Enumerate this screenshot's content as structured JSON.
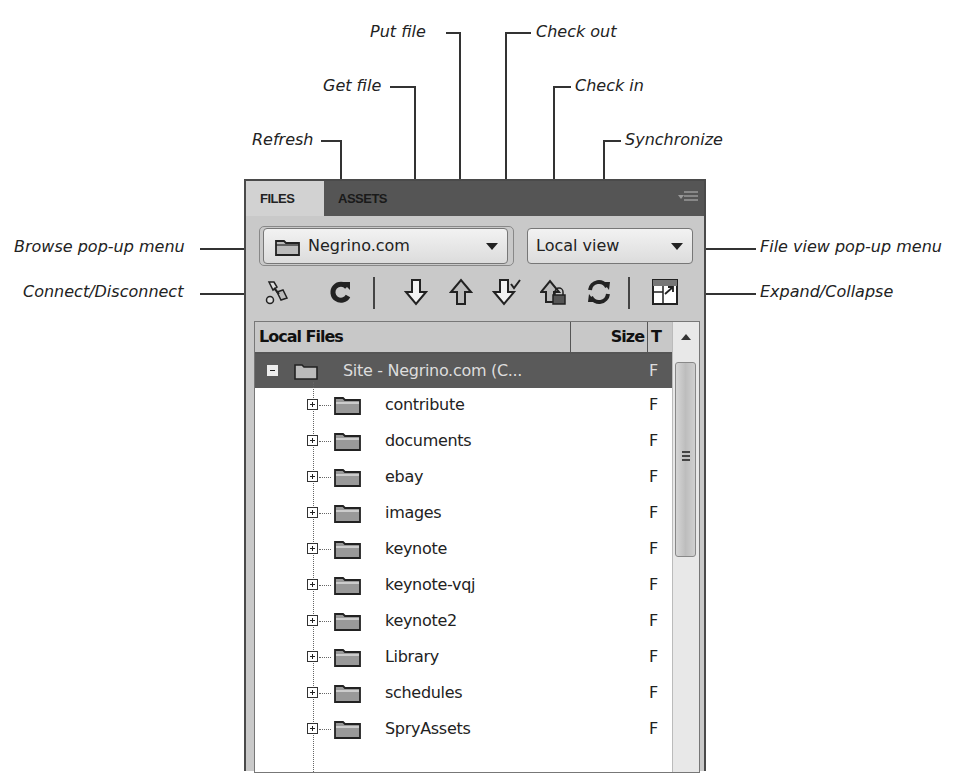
{
  "callouts": {
    "put_file": "Put file",
    "check_out": "Check out",
    "get_file": "Get file",
    "check_in": "Check in",
    "refresh": "Refresh",
    "synchronize": "Synchronize",
    "browse_menu": "Browse pop-up menu",
    "connect": "Connect/Disconnect",
    "file_view_menu": "File view pop-up menu",
    "expand_collapse": "Expand/Collapse"
  },
  "panel": {
    "tabs": [
      {
        "label": "FILES",
        "active": true
      },
      {
        "label": "ASSETS",
        "active": false
      }
    ],
    "menu_icon": "panel-options-icon",
    "site_select": {
      "value": "Negrino.com",
      "icon": "folder-icon"
    },
    "view_select": {
      "value": "Local view"
    },
    "toolbar": [
      {
        "name": "connect-disconnect",
        "icon": "plug-icon"
      },
      {
        "name": "refresh",
        "icon": "refresh-icon"
      },
      {
        "name": "get-file",
        "icon": "arrow-down-icon"
      },
      {
        "name": "put-file",
        "icon": "arrow-up-icon"
      },
      {
        "name": "check-out",
        "icon": "arrow-down-check-icon"
      },
      {
        "name": "check-in",
        "icon": "arrow-up-lock-icon"
      },
      {
        "name": "synchronize",
        "icon": "sync-icon"
      },
      {
        "name": "expand-collapse",
        "icon": "expand-icon"
      }
    ],
    "table": {
      "columns": [
        "Local Files",
        "Size",
        "T"
      ],
      "root": {
        "name": "Site - Negrino.com (C...",
        "type": "F"
      },
      "rows": [
        {
          "name": "contribute",
          "type": "F"
        },
        {
          "name": "documents",
          "type": "F"
        },
        {
          "name": "ebay",
          "type": "F"
        },
        {
          "name": "images",
          "type": "F"
        },
        {
          "name": "keynote",
          "type": "F"
        },
        {
          "name": "keynote-vqj",
          "type": "F"
        },
        {
          "name": "keynote2",
          "type": "F"
        },
        {
          "name": "Library",
          "type": "F"
        },
        {
          "name": "schedules",
          "type": "F"
        },
        {
          "name": "SpryAssets",
          "type": "F"
        }
      ]
    }
  }
}
